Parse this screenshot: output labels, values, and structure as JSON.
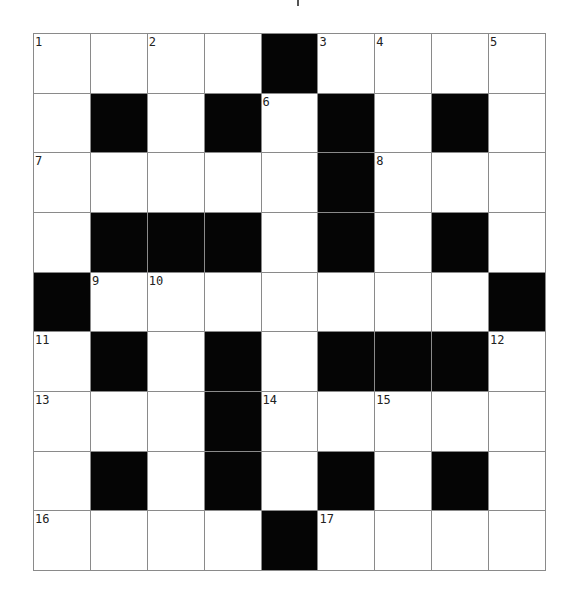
{
  "puzzle": {
    "rows": 9,
    "cols": 9,
    "colors": {
      "block": "#050505",
      "cell": "#ffffff",
      "gridline": "#8a8a8a",
      "number": "#222222"
    },
    "grid": [
      [
        "1",
        "",
        "2",
        "",
        "#",
        "3",
        "4",
        "",
        "5"
      ],
      [
        "",
        "#",
        "",
        "#",
        "6",
        "#",
        "",
        "#",
        ""
      ],
      [
        "7",
        "",
        "",
        "",
        "",
        "#",
        "8",
        "",
        ""
      ],
      [
        "",
        "#",
        "#",
        "#",
        "",
        "#",
        "",
        "#",
        ""
      ],
      [
        "#",
        "9",
        "10",
        "",
        "",
        "",
        "",
        "",
        "#"
      ],
      [
        "11",
        "#",
        "",
        "#",
        "",
        "#",
        "#",
        "#",
        "12"
      ],
      [
        "13",
        "",
        "",
        "#",
        "14",
        "",
        "15",
        "",
        ""
      ],
      [
        "",
        "#",
        "",
        "#",
        "",
        "#",
        "",
        "#",
        ""
      ],
      [
        "16",
        "",
        "",
        "",
        "#",
        "17",
        "",
        "",
        ""
      ]
    ]
  }
}
